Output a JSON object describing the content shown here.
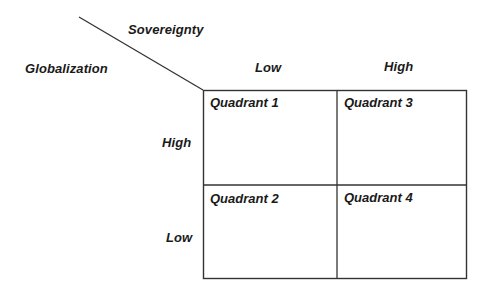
{
  "diagram": {
    "type": "2x2 matrix",
    "axes": {
      "column_axis": {
        "label": "Sovereignty",
        "levels": [
          "Low",
          "High"
        ]
      },
      "row_axis": {
        "label": "Globalization",
        "levels": [
          "High",
          "Low"
        ]
      }
    },
    "quadrants": [
      {
        "label": "Quadrant 1",
        "row": "High",
        "column": "Low"
      },
      {
        "label": "Quadrant 3",
        "row": "High",
        "column": "High"
      },
      {
        "label": "Quadrant 2",
        "row": "Low",
        "column": "Low"
      },
      {
        "label": "Quadrant 4",
        "row": "Low",
        "column": "High"
      }
    ],
    "line_color": "#333333",
    "text_color": "#1a1a1a"
  }
}
